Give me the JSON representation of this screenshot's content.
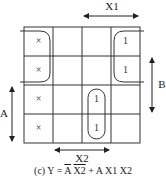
{
  "kmap": {
    "rows": 4,
    "cols": 4,
    "cells": [
      [
        "×",
        "",
        "",
        "1"
      ],
      [
        "×",
        "",
        "",
        "1"
      ],
      [
        "×",
        "",
        "1",
        ""
      ],
      [
        "×",
        "",
        "1",
        ""
      ]
    ],
    "variables": {
      "top": "X1",
      "right": "B",
      "left": "A",
      "bottom": "X2"
    }
  },
  "caption": {
    "prefix": "(c) Y = ",
    "term1_a": "A",
    "term1_b": "X2",
    "plus": " + ",
    "term2": "A X1 X2"
  }
}
